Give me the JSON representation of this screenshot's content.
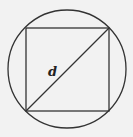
{
  "diagram": {
    "label_diagonal": "d",
    "colors": {
      "background": "#f2f2f2",
      "stroke": "#333333"
    },
    "circle": {
      "cx": 67,
      "cy": 69,
      "r": 59
    },
    "square": {
      "x1": 26,
      "y1": 28,
      "x2": 109,
      "y2": 111
    }
  }
}
